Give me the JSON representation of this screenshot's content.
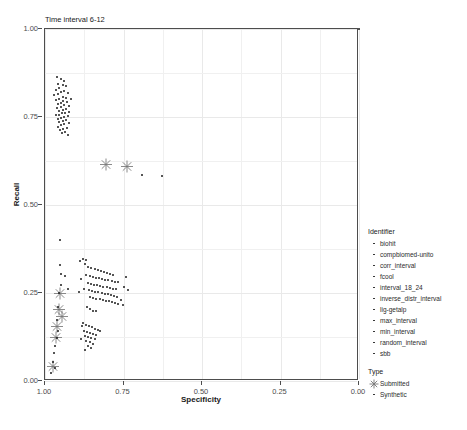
{
  "page_header": "",
  "caption": "",
  "chart_data": {
    "type": "scatter",
    "title": "Time interval 6-12",
    "xlabel": "Specificity",
    "ylabel": "Recall",
    "xlim": [
      1.0,
      0.0
    ],
    "x_reversed": true,
    "ylim": [
      0.0,
      1.0
    ],
    "xticks": [
      "1.00",
      "0.75",
      "0.50",
      "0.25",
      "0.00"
    ],
    "xtick_values": [
      1.0,
      0.75,
      0.5,
      0.25,
      0.0
    ],
    "yticks": [
      "0.00",
      "0.25",
      "0.50",
      "0.75",
      "1.00"
    ],
    "ytick_values": [
      0.0,
      0.25,
      0.5,
      0.75,
      1.0
    ],
    "grid": true,
    "legend_position": "right",
    "legends": [
      {
        "title": "Identifier",
        "marker": "dot",
        "entries": [
          "biohit",
          "compbiomed-unito",
          "corr_interval",
          "fcool",
          "interval_18_24",
          "inverse_distr_interval",
          "lig-getalp",
          "max_interval",
          "min_interval",
          "random_interval",
          "sbb"
        ]
      },
      {
        "title": "Type",
        "entries": [
          {
            "label": "Submitted",
            "marker": "asterisk"
          },
          {
            "label": "Synthetic",
            "marker": "dot"
          }
        ]
      }
    ],
    "series": [
      {
        "name": "Submitted",
        "marker": "asterisk",
        "points": [
          [
            0.805,
            0.61
          ],
          [
            0.74,
            0.605
          ],
          [
            0.952,
            0.243
          ],
          [
            0.957,
            0.198
          ],
          [
            0.962,
            0.15
          ],
          [
            0.966,
            0.12
          ],
          [
            0.975,
            0.038
          ],
          [
            0.945,
            0.178
          ]
        ]
      },
      {
        "name": "Synthetic",
        "marker": "dot",
        "points": [
          [
            0.0,
            1.0
          ],
          [
            0.69,
            0.585
          ],
          [
            0.628,
            0.582
          ],
          [
            0.952,
            0.4
          ],
          [
            0.952,
            0.33
          ],
          [
            0.948,
            0.305
          ],
          [
            0.95,
            0.272
          ],
          [
            0.955,
            0.25
          ],
          [
            0.958,
            0.21
          ],
          [
            0.962,
            0.172
          ],
          [
            0.958,
            0.143
          ],
          [
            0.963,
            0.122
          ],
          [
            0.968,
            0.1
          ],
          [
            0.972,
            0.08
          ],
          [
            0.975,
            0.055
          ],
          [
            0.968,
            0.036
          ],
          [
            0.98,
            0.022
          ],
          [
            0.935,
            0.298
          ],
          [
            0.928,
            0.262
          ],
          [
            0.963,
            0.865
          ],
          [
            0.95,
            0.858
          ],
          [
            0.94,
            0.852
          ],
          [
            0.958,
            0.845
          ],
          [
            0.944,
            0.84
          ],
          [
            0.932,
            0.838
          ],
          [
            0.955,
            0.832
          ],
          [
            0.966,
            0.828
          ],
          [
            0.938,
            0.825
          ],
          [
            0.948,
            0.82
          ],
          [
            0.926,
            0.818
          ],
          [
            0.96,
            0.815
          ],
          [
            0.972,
            0.812
          ],
          [
            0.944,
            0.808
          ],
          [
            0.934,
            0.805
          ],
          [
            0.954,
            0.802
          ],
          [
            0.918,
            0.8
          ],
          [
            0.965,
            0.798
          ],
          [
            0.942,
            0.795
          ],
          [
            0.93,
            0.792
          ],
          [
            0.95,
            0.79
          ],
          [
            0.958,
            0.786
          ],
          [
            0.938,
            0.783
          ],
          [
            0.922,
            0.781
          ],
          [
            0.948,
            0.778
          ],
          [
            0.962,
            0.776
          ],
          [
            0.932,
            0.773
          ],
          [
            0.944,
            0.77
          ],
          [
            0.954,
            0.768
          ],
          [
            0.925,
            0.765
          ],
          [
            0.936,
            0.762
          ],
          [
            0.946,
            0.76
          ],
          [
            0.956,
            0.757
          ],
          [
            0.966,
            0.755
          ],
          [
            0.928,
            0.752
          ],
          [
            0.94,
            0.75
          ],
          [
            0.95,
            0.747
          ],
          [
            0.96,
            0.744
          ],
          [
            0.934,
            0.741
          ],
          [
            0.944,
            0.738
          ],
          [
            0.954,
            0.735
          ],
          [
            0.924,
            0.732
          ],
          [
            0.938,
            0.729
          ],
          [
            0.948,
            0.726
          ],
          [
            0.958,
            0.723
          ],
          [
            0.93,
            0.72
          ],
          [
            0.942,
            0.716
          ],
          [
            0.952,
            0.712
          ],
          [
            0.936,
            0.708
          ],
          [
            0.946,
            0.704
          ],
          [
            0.926,
            0.7
          ],
          [
            0.872,
            0.332
          ],
          [
            0.862,
            0.325
          ],
          [
            0.852,
            0.32
          ],
          [
            0.842,
            0.318
          ],
          [
            0.832,
            0.315
          ],
          [
            0.822,
            0.312
          ],
          [
            0.812,
            0.31
          ],
          [
            0.802,
            0.308
          ],
          [
            0.792,
            0.305
          ],
          [
            0.782,
            0.302
          ],
          [
            0.868,
            0.3
          ],
          [
            0.858,
            0.298
          ],
          [
            0.848,
            0.296
          ],
          [
            0.838,
            0.294
          ],
          [
            0.828,
            0.292
          ],
          [
            0.818,
            0.29
          ],
          [
            0.808,
            0.288
          ],
          [
            0.798,
            0.286
          ],
          [
            0.788,
            0.284
          ],
          [
            0.778,
            0.282
          ],
          [
            0.768,
            0.28
          ],
          [
            0.864,
            0.278
          ],
          [
            0.854,
            0.276
          ],
          [
            0.844,
            0.274
          ],
          [
            0.834,
            0.272
          ],
          [
            0.824,
            0.27
          ],
          [
            0.814,
            0.268
          ],
          [
            0.804,
            0.266
          ],
          [
            0.794,
            0.264
          ],
          [
            0.784,
            0.262
          ],
          [
            0.774,
            0.26
          ],
          [
            0.86,
            0.258
          ],
          [
            0.85,
            0.256
          ],
          [
            0.84,
            0.254
          ],
          [
            0.83,
            0.252
          ],
          [
            0.82,
            0.25
          ],
          [
            0.81,
            0.248
          ],
          [
            0.8,
            0.246
          ],
          [
            0.79,
            0.244
          ],
          [
            0.78,
            0.242
          ],
          [
            0.77,
            0.24
          ],
          [
            0.856,
            0.238
          ],
          [
            0.846,
            0.236
          ],
          [
            0.836,
            0.234
          ],
          [
            0.826,
            0.232
          ],
          [
            0.816,
            0.23
          ],
          [
            0.806,
            0.228
          ],
          [
            0.796,
            0.226
          ],
          [
            0.786,
            0.224
          ],
          [
            0.776,
            0.222
          ],
          [
            0.766,
            0.22
          ],
          [
            0.88,
            0.348
          ],
          [
            0.87,
            0.345
          ],
          [
            0.89,
            0.34
          ],
          [
            0.884,
            0.29
          ],
          [
            0.876,
            0.262
          ],
          [
            0.892,
            0.252
          ],
          [
            0.748,
            0.268
          ],
          [
            0.742,
            0.295
          ],
          [
            0.736,
            0.258
          ],
          [
            0.758,
            0.23
          ],
          [
            0.752,
            0.215
          ],
          [
            0.866,
            0.21
          ],
          [
            0.856,
            0.205
          ],
          [
            0.846,
            0.2
          ],
          [
            0.836,
            0.198
          ],
          [
            0.88,
            0.165
          ],
          [
            0.87,
            0.16
          ],
          [
            0.86,
            0.156
          ],
          [
            0.85,
            0.152
          ],
          [
            0.84,
            0.149
          ],
          [
            0.83,
            0.146
          ],
          [
            0.876,
            0.142
          ],
          [
            0.866,
            0.139
          ],
          [
            0.856,
            0.136
          ],
          [
            0.846,
            0.133
          ],
          [
            0.836,
            0.13
          ],
          [
            0.872,
            0.127
          ],
          [
            0.862,
            0.124
          ],
          [
            0.852,
            0.121
          ],
          [
            0.842,
            0.118
          ],
          [
            0.868,
            0.114
          ],
          [
            0.858,
            0.11
          ],
          [
            0.848,
            0.106
          ],
          [
            0.864,
            0.1
          ],
          [
            0.854,
            0.094
          ],
          [
            0.874,
            0.088
          ],
          [
            0.882,
            0.155
          ],
          [
            0.826,
            0.143
          ],
          [
            0.886,
            0.12
          ]
        ]
      }
    ]
  }
}
